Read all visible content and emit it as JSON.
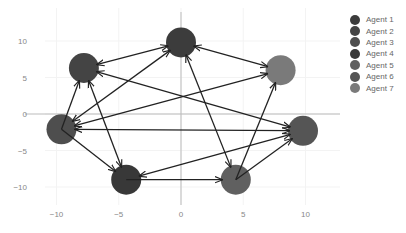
{
  "chart_data": {
    "type": "network",
    "title": "",
    "xlabel": "",
    "ylabel": "",
    "xlim": [
      -11.5,
      12.5
    ],
    "ylim": [
      -13.5,
      13.5
    ],
    "x_ticks": [
      -10,
      -5,
      0,
      5,
      10
    ],
    "y_ticks": [
      10,
      5,
      0,
      -5,
      -10
    ],
    "grid": true,
    "legend_position": "right",
    "nodes": [
      {
        "name": "Agent 1",
        "x": 0.0,
        "y": 9.8,
        "color": "#3c3c3c"
      },
      {
        "name": "Agent 2",
        "x": -7.8,
        "y": 6.3,
        "color": "#444444"
      },
      {
        "name": "Agent 3",
        "x": -9.6,
        "y": -2.1,
        "color": "#4e4e4e"
      },
      {
        "name": "Agent 4",
        "x": -4.4,
        "y": -9.0,
        "color": "#383838"
      },
      {
        "name": "Agent 5",
        "x": 4.4,
        "y": -9.0,
        "color": "#606060"
      },
      {
        "name": "Agent 6",
        "x": 9.8,
        "y": -2.3,
        "color": "#555555"
      },
      {
        "name": "Agent 7",
        "x": 8.0,
        "y": 6.0,
        "color": "#7a7a7a"
      }
    ],
    "edges": [
      {
        "from": "Agent 1",
        "to": "Agent 2",
        "both": true
      },
      {
        "from": "Agent 1",
        "to": "Agent 7",
        "both": true
      },
      {
        "from": "Agent 3",
        "to": "Agent 1",
        "both": true
      },
      {
        "from": "Agent 1",
        "to": "Agent 5",
        "both": true
      },
      {
        "from": "Agent 2",
        "to": "Agent 6",
        "both": true
      },
      {
        "from": "Agent 3",
        "to": "Agent 2",
        "both": false
      },
      {
        "from": "Agent 4",
        "to": "Agent 2",
        "both": true
      },
      {
        "from": "Agent 3",
        "to": "Agent 7",
        "both": true
      },
      {
        "from": "Agent 3",
        "to": "Agent 6",
        "both": true
      },
      {
        "from": "Agent 3",
        "to": "Agent 4",
        "both": false
      },
      {
        "from": "Agent 4",
        "to": "Agent 5",
        "both": false
      },
      {
        "from": "Agent 6",
        "to": "Agent 4",
        "both": true
      },
      {
        "from": "Agent 5",
        "to": "Agent 6",
        "both": false
      },
      {
        "from": "Agent 5",
        "to": "Agent 7",
        "both": false
      }
    ]
  },
  "legend": {
    "items": [
      {
        "label": "Agent 1",
        "color": "#3c3c3c"
      },
      {
        "label": "Agent 2",
        "color": "#444444"
      },
      {
        "label": "Agent 3",
        "color": "#4e4e4e"
      },
      {
        "label": "Agent 4",
        "color": "#383838"
      },
      {
        "label": "Agent 5",
        "color": "#606060"
      },
      {
        "label": "Agent 6",
        "color": "#555555"
      },
      {
        "label": "Agent 7",
        "color": "#7a7a7a"
      }
    ]
  }
}
